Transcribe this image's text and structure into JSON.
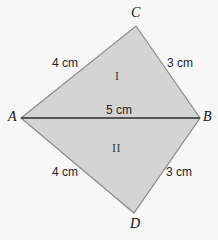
{
  "figure": {
    "type": "geometry-quadrilateral-diagram",
    "background_color": "#f7f7f7",
    "fill_color": "#d4d4d4",
    "outline_color": "#8a8a8a",
    "diagonal_color": "#2b2b2b",
    "width": 218,
    "height": 240,
    "vertices": [
      {
        "name": "A",
        "label": "A",
        "x": 21,
        "y": 118
      },
      {
        "name": "B",
        "label": "B",
        "x": 200,
        "y": 118
      },
      {
        "name": "C",
        "label": "C",
        "x": 136,
        "y": 26
      },
      {
        "name": "D",
        "label": "D",
        "x": 134,
        "y": 213
      }
    ],
    "edges": [
      {
        "name": "edge-AC",
        "from": "A",
        "to": "C",
        "length_label": "4 cm"
      },
      {
        "name": "edge-CB",
        "from": "C",
        "to": "B",
        "length_label": "3 cm"
      },
      {
        "name": "edge-AD",
        "from": "A",
        "to": "D",
        "length_label": "4 cm"
      },
      {
        "name": "edge-DB",
        "from": "D",
        "to": "B",
        "length_label": "3 cm"
      }
    ],
    "diagonal": {
      "name": "diagonal-AB",
      "from": "A",
      "to": "B",
      "length_label": "5 cm"
    },
    "regions": [
      {
        "name": "region-upper",
        "label": "I",
        "bounded_by": "A-C-B"
      },
      {
        "name": "region-lower",
        "label": "II",
        "bounded_by": "A-D-B"
      }
    ],
    "labels": {
      "vertex_a": "A",
      "vertex_b": "B",
      "vertex_c": "C",
      "vertex_d": "D",
      "measure_ac": "4 cm",
      "measure_cb": "3 cm",
      "measure_ab": "5 cm",
      "measure_ad": "4 cm",
      "measure_db": "3 cm",
      "region_one": "I",
      "region_two": "II"
    }
  }
}
